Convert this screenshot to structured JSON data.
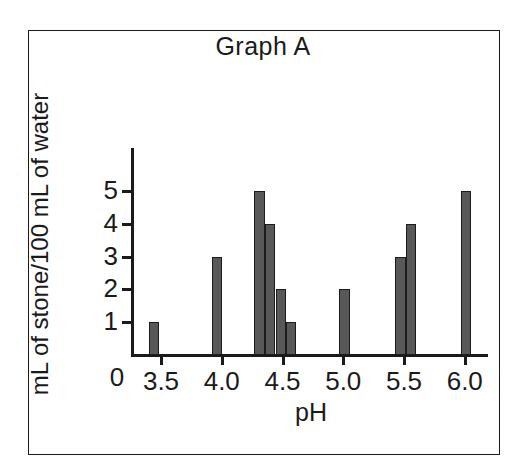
{
  "figure": {
    "title": "Graph A",
    "x_axis_title": "pH",
    "y_axis_title": "mL of stone/100 mL of water",
    "origin_label": "0",
    "bar_color": "#585858",
    "bar_outline_color": "#1c1c1c",
    "axis_color": "#1a1a1a",
    "background_color": "#ffffff",
    "frame_color": "#1a1a1a"
  },
  "y_ticks": [
    {
      "label": "1",
      "value": 1
    },
    {
      "label": "2",
      "value": 2
    },
    {
      "label": "3",
      "value": 3
    },
    {
      "label": "4",
      "value": 4
    },
    {
      "label": "5",
      "value": 5
    }
  ],
  "x_ticks": [
    {
      "label": "3.5",
      "value": 3.5
    },
    {
      "label": "4.0",
      "value": 4.0
    },
    {
      "label": "4.5",
      "value": 4.5
    },
    {
      "label": "5.0",
      "value": 5.0
    },
    {
      "label": "5.5",
      "value": 5.5
    },
    {
      "label": "6.0",
      "value": 6.0
    }
  ],
  "chart_data": {
    "type": "bar",
    "title": "Graph A",
    "xlabel": "pH",
    "ylabel": "mL of stone/100 mL of water",
    "xlim": [
      3.2,
      6.2
    ],
    "ylim": [
      0,
      6
    ],
    "grid": false,
    "legend": "none",
    "x_tick_labels": [
      "3.5",
      "4.0",
      "4.5",
      "5.0",
      "5.5",
      "6.0"
    ],
    "y_tick_labels": [
      "0",
      "1",
      "2",
      "3",
      "4",
      "5"
    ],
    "bar_width_ph": 0.085,
    "bars": [
      {
        "x": 3.44,
        "value": 1
      },
      {
        "x": 3.96,
        "value": 3
      },
      {
        "x": 4.31,
        "value": 5
      },
      {
        "x": 4.4,
        "value": 4
      },
      {
        "x": 4.49,
        "value": 2
      },
      {
        "x": 4.57,
        "value": 1
      },
      {
        "x": 5.01,
        "value": 2
      },
      {
        "x": 5.47,
        "value": 3
      },
      {
        "x": 5.56,
        "value": 4
      },
      {
        "x": 6.01,
        "value": 5
      }
    ],
    "x": [
      3.44,
      3.96,
      4.31,
      4.4,
      4.49,
      4.57,
      5.01,
      5.47,
      5.56,
      6.01
    ],
    "values": [
      1,
      3,
      5,
      4,
      2,
      1,
      2,
      3,
      4,
      5
    ]
  }
}
